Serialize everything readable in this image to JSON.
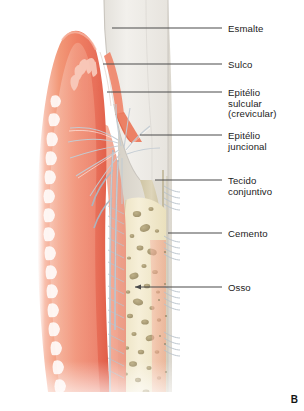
{
  "figure": {
    "letter": "B",
    "language": "pt-BR"
  },
  "labels": [
    {
      "id": "esmalte",
      "text": "Esmalte",
      "text_x": 228,
      "text_y": 24,
      "line": {
        "x1": 112,
        "y1": 28,
        "x2": 222,
        "y2": 28
      },
      "arrow": false
    },
    {
      "id": "sulco",
      "text": "Sulco",
      "text_x": 228,
      "text_y": 60,
      "line": {
        "x1": 103,
        "y1": 64,
        "x2": 222,
        "y2": 64
      },
      "arrow": false
    },
    {
      "id": "epitelio-sulcular",
      "text": "Epitélio\nsulcular\n(crevicular)",
      "text_x": 228,
      "text_y": 88,
      "line": {
        "x1": 107,
        "y1": 92,
        "x2": 222,
        "y2": 92
      },
      "arrow": false
    },
    {
      "id": "epitelio-juncional",
      "text": "Epitélio\njuncional",
      "text_x": 228,
      "text_y": 131,
      "line": {
        "x1": 140,
        "y1": 135,
        "x2": 222,
        "y2": 135
      },
      "arrow": false
    },
    {
      "id": "tecido-conjuntivo",
      "text": "Tecido\nconjuntivo",
      "text_x": 228,
      "text_y": 176,
      "line": {
        "x1": 155,
        "y1": 180,
        "x2": 222,
        "y2": 180
      },
      "arrow": false
    },
    {
      "id": "cemento",
      "text": "Cemento",
      "text_x": 228,
      "text_y": 229,
      "line": {
        "x1": 168,
        "y1": 233,
        "x2": 222,
        "y2": 233
      },
      "arrow": false
    },
    {
      "id": "osso",
      "text": "Osso",
      "text_x": 228,
      "text_y": 283,
      "line": {
        "x1": 135,
        "y1": 287,
        "x2": 222,
        "y2": 287
      },
      "arrow": true
    }
  ],
  "colors": {
    "leader_line": "#4a4a4a",
    "label_text": "#1b1b1b",
    "gingiva_light": "#f6b5a3",
    "gingiva_mid": "#ef7f63",
    "gingiva_deep": "#e0614a",
    "gingiva_core": "#f4a08c",
    "connective": "#f2a794",
    "enamel": "#eceae5",
    "enamel_edge": "#cfccc6",
    "dentin": "#dedad2",
    "cementum": "#cfc6a8",
    "bone": "#f2ead0",
    "bone_marrow": "#9a8c63",
    "pdl_fiber": "#b9c3cb",
    "vessel": "#aab8c4",
    "background": "#ffffff"
  },
  "structures": [
    {
      "name": "enamel",
      "label": "Esmalte"
    },
    {
      "name": "gingival-sulcus",
      "label": "Sulco"
    },
    {
      "name": "sulcular-epithelium",
      "label": "Epitélio sulcular (crevicular)"
    },
    {
      "name": "junctional-epithelium",
      "label": "Epitélio juncional"
    },
    {
      "name": "connective-tissue",
      "label": "Tecido conjuntivo"
    },
    {
      "name": "cementum",
      "label": "Cemento"
    },
    {
      "name": "alveolar-bone",
      "label": "Osso"
    },
    {
      "name": "gingiva",
      "label": "Gengiva"
    },
    {
      "name": "rete-pegs",
      "label": "Cristas epiteliais"
    },
    {
      "name": "periodontal-ligament",
      "label": "Ligamento periodontal"
    }
  ]
}
